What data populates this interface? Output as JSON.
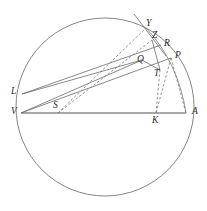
{
  "figure": {
    "kind": "geometry-diagram",
    "width": 207,
    "height": 211,
    "background_color": "#ffffff",
    "stroke_color": "#555555",
    "label_color": "#2b2b2b",
    "axis_color": "#8a8a8a"
  },
  "circle": {
    "name": "main-circle",
    "cx": 105,
    "cy": 107,
    "r": 89,
    "stroke": "#777777",
    "stroke_width": 0.9,
    "fill": "none"
  },
  "points": [
    {
      "id": "L",
      "label": "L",
      "x": 22,
      "y": 94,
      "label_x": 11,
      "label_y": 87
    },
    {
      "id": "V",
      "label": "V",
      "x": 21,
      "y": 113,
      "label_x": 11,
      "label_y": 107
    },
    {
      "id": "S",
      "label": "S",
      "x": 58,
      "y": 113,
      "label_x": 53,
      "label_y": 101
    },
    {
      "id": "K",
      "label": "K",
      "x": 156,
      "y": 113,
      "label_x": 152,
      "label_y": 116
    },
    {
      "id": "A",
      "label": "A",
      "x": 186,
      "y": 113,
      "label_x": 192,
      "label_y": 107
    },
    {
      "id": "T",
      "label": "T",
      "x": 160,
      "y": 70,
      "label_x": 154,
      "label_y": 69
    },
    {
      "id": "P",
      "label": "P",
      "x": 171,
      "y": 58,
      "label_x": 175,
      "label_y": 51
    },
    {
      "id": "Q",
      "label": "Q",
      "x": 142,
      "y": 60,
      "label_x": 137,
      "label_y": 55
    },
    {
      "id": "R",
      "label": "R",
      "x": 161,
      "y": 45,
      "label_x": 164,
      "label_y": 39
    },
    {
      "id": "Z",
      "label": "Z",
      "x": 152,
      "y": 40,
      "label_x": 152,
      "label_y": 31
    },
    {
      "id": "Y",
      "label": "Y",
      "x": 146,
      "y": 28,
      "label_x": 146,
      "label_y": 19
    }
  ],
  "segments": [
    {
      "name": "diameter-VA",
      "from": "V",
      "to": "A",
      "style": "solid",
      "stroke": "#8a8a8a",
      "width": 1.6
    },
    {
      "name": "chord-V-P",
      "from": "V",
      "to": "P",
      "style": "solid",
      "stroke": "#6b6b6b",
      "width": 0.8
    },
    {
      "name": "chord-L-R",
      "from": "L",
      "to": "R",
      "style": "solid",
      "stroke": "#6b6b6b",
      "width": 0.8
    },
    {
      "name": "chord-L-Q",
      "from": "L",
      "to": "Q",
      "style": "solid",
      "stroke": "#6b6b6b",
      "width": 0.8
    },
    {
      "name": "chord-V-Q",
      "from": "V",
      "to": "Q",
      "style": "solid",
      "stroke": "#6b6b6b",
      "width": 0.8
    },
    {
      "name": "segment-Q-T",
      "from": "Q",
      "to": "T",
      "style": "solid",
      "stroke": "#6b6b6b",
      "width": 0.8
    },
    {
      "name": "segment-Z-T",
      "from": "Z",
      "to": "T",
      "style": "solid",
      "stroke": "#6b6b6b",
      "width": 0.8
    },
    {
      "name": "dashed-S-Y",
      "from": "S",
      "to": "Y",
      "style": "dashed",
      "stroke": "#7a7a7a",
      "width": 0.8
    },
    {
      "name": "dashed-S-Z",
      "from": "S",
      "to": "Z",
      "style": "dashed",
      "stroke": "#7a7a7a",
      "width": 0.8
    },
    {
      "name": "dashed-T-K",
      "from": "T",
      "to": "K",
      "style": "dashed",
      "stroke": "#7a7a7a",
      "width": 0.8
    },
    {
      "name": "dashed-P-K",
      "from": "P",
      "to": "K",
      "style": "dashed",
      "stroke": "#7a7a7a",
      "width": 0.8
    },
    {
      "name": "dashed-P-A",
      "from": "P",
      "to": "A",
      "style": "dashed",
      "stroke": "#7a7a7a",
      "width": 0.8
    }
  ],
  "tangent_line": {
    "name": "tangent-at-Z",
    "x1": 134,
    "y1": 14,
    "x2": 166,
    "y2": 56,
    "style": "solid",
    "stroke": "#6b6b6b",
    "width": 0.8
  },
  "arcs": [
    {
      "name": "arc-Y-to-A",
      "path": "M 146 28 Q 178 62 186 113",
      "style": "solid",
      "stroke": "#777777",
      "width": 0.8
    }
  ],
  "labels": {
    "L": "L",
    "V": "V",
    "S": "S",
    "K": "K",
    "A": "A",
    "T": "T",
    "P": "P",
    "Q": "Q",
    "R": "R",
    "Z": "Z",
    "Y": "Y"
  }
}
